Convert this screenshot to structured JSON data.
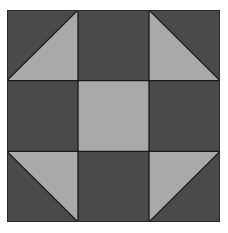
{
  "diagram": {
    "type": "quilt-block",
    "grid": {
      "rows": 3,
      "cols": 3
    },
    "colors": {
      "dark": "#4a4a4a",
      "light": "#a9a9a9",
      "line": "#1a1a1a"
    },
    "cells": [
      {
        "row": 0,
        "col": 0,
        "kind": "half-square-triangle",
        "light_corner": "bottom-right"
      },
      {
        "row": 0,
        "col": 1,
        "kind": "solid",
        "fill": "dark"
      },
      {
        "row": 0,
        "col": 2,
        "kind": "half-square-triangle",
        "light_corner": "bottom-left"
      },
      {
        "row": 1,
        "col": 0,
        "kind": "solid",
        "fill": "dark"
      },
      {
        "row": 1,
        "col": 1,
        "kind": "solid",
        "fill": "light"
      },
      {
        "row": 1,
        "col": 2,
        "kind": "solid",
        "fill": "dark"
      },
      {
        "row": 2,
        "col": 0,
        "kind": "half-square-triangle",
        "light_corner": "top-right"
      },
      {
        "row": 2,
        "col": 1,
        "kind": "solid",
        "fill": "dark"
      },
      {
        "row": 2,
        "col": 2,
        "kind": "half-square-triangle",
        "light_corner": "top-left"
      }
    ]
  }
}
